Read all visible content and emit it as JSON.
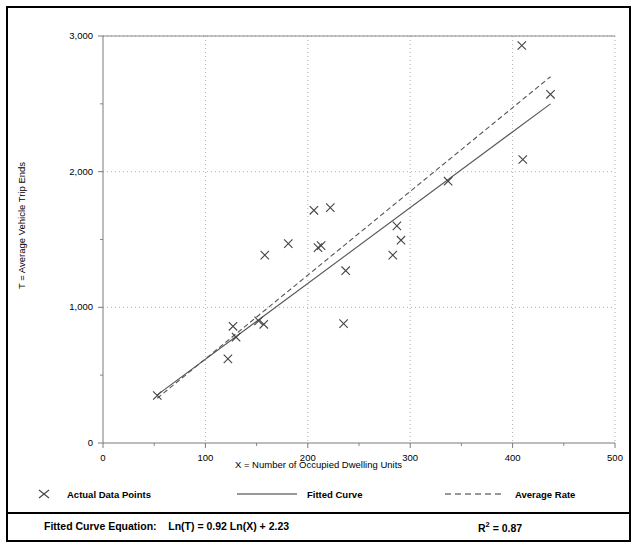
{
  "chart_data": {
    "type": "scatter",
    "title": "",
    "xlabel": "X = Number of Occupied Dwelling Units",
    "ylabel": "T = Average Vehicle Trip Ends",
    "xlim": [
      0,
      500
    ],
    "ylim": [
      0,
      3000
    ],
    "xticks": [
      0,
      100,
      200,
      300,
      400,
      500
    ],
    "xtick_labels": [
      "0",
      "100",
      "200",
      "300",
      "400",
      "500"
    ],
    "xminorticks": [
      50,
      150,
      250,
      350,
      450
    ],
    "yticks": [
      0,
      1000,
      2000,
      3000
    ],
    "ytick_labels": [
      "0",
      "1,000",
      "2,000",
      "3,000"
    ],
    "yminorticks": [
      500,
      1500,
      2500
    ],
    "grid": "dotted-major",
    "legend_position": "below-axes",
    "series": [
      {
        "name": "Actual Data Points",
        "type": "scatter",
        "marker": "x",
        "points": [
          [
            53,
            350
          ],
          [
            122,
            620
          ],
          [
            127,
            860
          ],
          [
            130,
            780
          ],
          [
            152,
            900
          ],
          [
            157,
            875
          ],
          [
            158,
            1385
          ],
          [
            181,
            1470
          ],
          [
            206,
            1715
          ],
          [
            210,
            1440
          ],
          [
            213,
            1455
          ],
          [
            222,
            1735
          ],
          [
            235,
            880
          ],
          [
            237,
            1270
          ],
          [
            283,
            1385
          ],
          [
            287,
            1600
          ],
          [
            291,
            1495
          ],
          [
            337,
            1930
          ],
          [
            409,
            2930
          ],
          [
            410,
            2090
          ],
          [
            437,
            2570
          ]
        ]
      },
      {
        "name": "Fitted Curve",
        "type": "line",
        "style": "solid",
        "equation": "Ln(T) = 0.92 Ln(X) + 2.23",
        "points": [
          [
            53,
            355
          ],
          [
            437,
            2500
          ]
        ]
      },
      {
        "name": "Average Rate",
        "type": "line",
        "style": "dashed",
        "points": [
          [
            53,
            330
          ],
          [
            437,
            2700
          ]
        ]
      }
    ]
  },
  "legend": {
    "items": [
      {
        "label": "Actual Data Points",
        "marker": "x-marker-icon"
      },
      {
        "label": "Fitted Curve",
        "marker": "solid-line-icon"
      },
      {
        "label": "Average Rate",
        "marker": "dashed-line-icon"
      }
    ]
  },
  "footer": {
    "equation_label": "Fitted Curve Equation:",
    "equation": "Ln(T) = 0.92 Ln(X) + 2.23",
    "r2_label": "R",
    "r2_exp": "2",
    "r2_value": " = 0.87"
  },
  "colors": {
    "axis": "#7a7a7a",
    "grid": "#9a9a9a",
    "marker": "#444444",
    "line": "#555555",
    "border": "#000000",
    "text": "#000000"
  }
}
